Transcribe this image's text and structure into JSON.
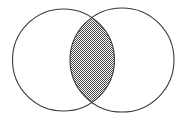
{
  "figure": {
    "name": "venn-diagram-two-set-intersection",
    "type": "venn-diagram",
    "title": "",
    "caption": "",
    "width": 189,
    "height": 121,
    "background_color": "#ffffff"
  },
  "style": {
    "stroke_color": "#3a3a3a",
    "stroke_width": 1.1,
    "circle_fill": "#ffffff",
    "intersection_fill_pattern": "checkerboard-50-percent",
    "intersection_pattern_color": "#4a4a4a",
    "intersection_pattern_background": "#ffffff",
    "intersection_pattern_cell_size": 1
  },
  "sets": [
    {
      "id": "left-set",
      "label": "",
      "center_x": 63.5,
      "center_y": 60,
      "radius": 51,
      "fill": "#ffffff",
      "shaded": false
    },
    {
      "id": "right-set",
      "label": "",
      "center_x": 122,
      "center_y": 60,
      "radius": 52,
      "fill": "#ffffff",
      "shaded": false
    }
  ],
  "regions": [
    {
      "id": "left-only",
      "label": "",
      "shaded": false
    },
    {
      "id": "intersection",
      "label": "",
      "shaded": true,
      "shading": "checkerboard-50-percent",
      "crossing_point_top_x": 94,
      "crossing_point_top_y": 15,
      "crossing_point_bottom_x": 94,
      "crossing_point_bottom_y": 103
    },
    {
      "id": "right-only",
      "label": "",
      "shaded": false
    }
  ],
  "labels": []
}
